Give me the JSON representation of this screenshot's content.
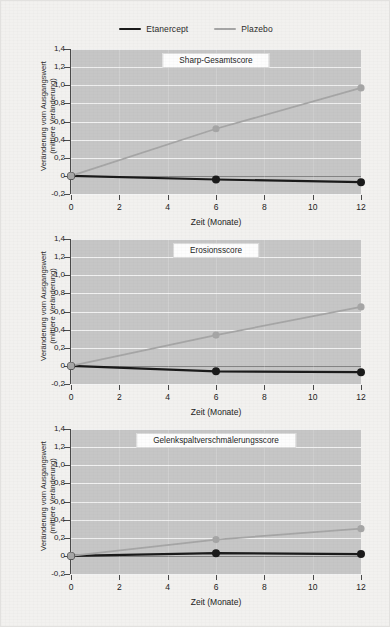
{
  "legend": {
    "items": [
      {
        "label": "Etanercept",
        "color": "#1a1a1a"
      },
      {
        "label": "Plazebo",
        "color": "#a6a6a6"
      }
    ]
  },
  "axis": {
    "xlabel": "Zeit (Monate)",
    "ylabel": "Veränderung vom Ausgangswert\n(mittlere Veränderung)",
    "xticks": [
      "0",
      "2",
      "4",
      "6",
      "8",
      "10",
      "12"
    ],
    "yticks": [
      "1,4",
      "1,2",
      "1,0",
      "0,8",
      "0,6",
      "0,4",
      "0,2",
      "0",
      "-0,2"
    ]
  },
  "colors": {
    "plot_background": "#c6c6c6",
    "gridline": "#f4f4f4",
    "page_background": "#f2f1ef",
    "etanercept": "#1a1a1a",
    "plazebo": "#a6a6a6"
  },
  "chart_data": [
    {
      "type": "line",
      "title": "Sharp-Gesamtscore",
      "xlabel": "Zeit (Monate)",
      "ylabel": "Veränderung vom Ausgangswert (mittlere Veränderung)",
      "x": [
        0,
        6,
        12
      ],
      "xlim": [
        0,
        12
      ],
      "ylim": [
        -0.2,
        1.4
      ],
      "grid": true,
      "legend_position": "top-center",
      "series": [
        {
          "name": "Etanercept",
          "color": "#1a1a1a",
          "values": [
            0.0,
            -0.04,
            -0.07
          ]
        },
        {
          "name": "Plazebo",
          "color": "#a6a6a6",
          "values": [
            0.0,
            0.52,
            0.97
          ]
        }
      ]
    },
    {
      "type": "line",
      "title": "Erosionsscore",
      "xlabel": "Zeit (Monate)",
      "ylabel": "Veränderung vom Ausgangswert (mittlere Veränderung)",
      "x": [
        0,
        6,
        12
      ],
      "xlim": [
        0,
        12
      ],
      "ylim": [
        -0.2,
        1.4
      ],
      "grid": true,
      "legend_position": "top-center",
      "series": [
        {
          "name": "Etanercept",
          "color": "#1a1a1a",
          "values": [
            0.0,
            -0.06,
            -0.07
          ]
        },
        {
          "name": "Plazebo",
          "color": "#a6a6a6",
          "values": [
            0.0,
            0.34,
            0.65
          ]
        }
      ]
    },
    {
      "type": "line",
      "title": "Gelenkspaltverschmälerungsscore",
      "xlabel": "Zeit (Monate)",
      "ylabel": "Veränderung vom Ausgangswert (mittlere Veränderung)",
      "x": [
        0,
        6,
        12
      ],
      "xlim": [
        0,
        12
      ],
      "ylim": [
        -0.2,
        1.4
      ],
      "grid": true,
      "legend_position": "top-center",
      "series": [
        {
          "name": "Etanercept",
          "color": "#1a1a1a",
          "values": [
            0.0,
            0.03,
            0.02
          ]
        },
        {
          "name": "Plazebo",
          "color": "#a6a6a6",
          "values": [
            0.0,
            0.18,
            0.3
          ]
        }
      ]
    }
  ]
}
